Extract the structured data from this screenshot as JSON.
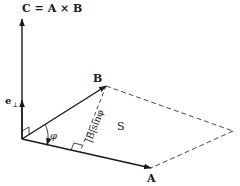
{
  "title_label": "C = A × B",
  "labels": {
    "C_eq": "C = A × B",
    "A": "A",
    "B": "B",
    "e_perp": "e",
    "perp_sub": "⊥",
    "phi": "φ",
    "height": "|B|sinφ",
    "area": "S"
  },
  "colors": {
    "line": "#1a1a1a",
    "dashed": "#333333"
  }
}
